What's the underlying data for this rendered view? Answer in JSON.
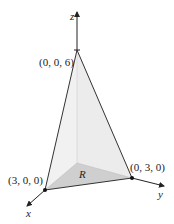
{
  "diagram": {
    "type": "3d-tetrahedron",
    "axes": {
      "x_label": "x",
      "y_label": "y",
      "z_label": "z"
    },
    "points": {
      "apex": "(0, 0, 6)",
      "x_intercept": "(3, 0, 0)",
      "y_intercept": "(0, 3, 0)"
    },
    "region_label": "R",
    "colors": {
      "left_face": "#f2f2f2",
      "right_face": "#e9e9e9",
      "base_region": "#cfcfcf",
      "edges": "#333333"
    }
  }
}
